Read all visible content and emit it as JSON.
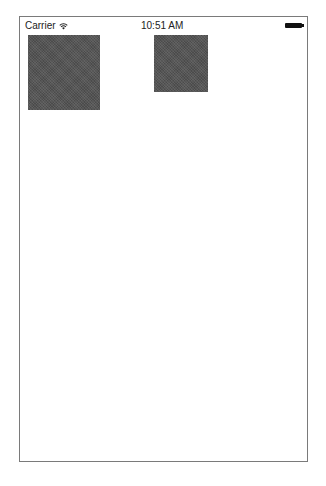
{
  "status_bar": {
    "carrier": "Carrier",
    "wifi_icon": "wifi-icon",
    "time": "10:51 AM",
    "battery_icon": "battery-full-icon"
  },
  "views": [
    {
      "name": "square-view-1",
      "color": "#555555"
    },
    {
      "name": "square-view-2",
      "color": "#555555"
    }
  ]
}
